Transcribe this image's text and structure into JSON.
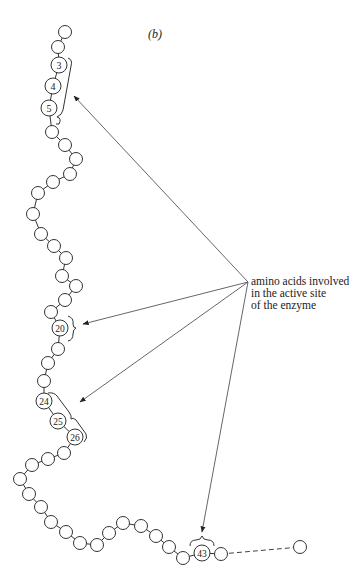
{
  "panel_label": "(b)",
  "annotation": {
    "lines": [
      "amino acids involved",
      "in the active site",
      "of the enzyme"
    ],
    "origin": [
      248,
      282
    ]
  },
  "colors": {
    "stroke": "#333333",
    "arrow": "#555555",
    "background": "#ffffff"
  },
  "chain": {
    "residues": [
      {
        "x": 65,
        "y": 32,
        "n": ""
      },
      {
        "x": 58,
        "y": 47,
        "n": ""
      },
      {
        "x": 59,
        "y": 65,
        "n": "3"
      },
      {
        "x": 53,
        "y": 86,
        "n": "4"
      },
      {
        "x": 49,
        "y": 108,
        "n": "5"
      },
      {
        "x": 52,
        "y": 132,
        "n": ""
      },
      {
        "x": 65,
        "y": 145,
        "n": ""
      },
      {
        "x": 76,
        "y": 159,
        "n": ""
      },
      {
        "x": 70,
        "y": 174,
        "n": ""
      },
      {
        "x": 53,
        "y": 182,
        "n": ""
      },
      {
        "x": 38,
        "y": 193,
        "n": ""
      },
      {
        "x": 33,
        "y": 214,
        "n": ""
      },
      {
        "x": 41,
        "y": 234,
        "n": ""
      },
      {
        "x": 54,
        "y": 246,
        "n": ""
      },
      {
        "x": 66,
        "y": 258,
        "n": ""
      },
      {
        "x": 62,
        "y": 276,
        "n": ""
      },
      {
        "x": 76,
        "y": 286,
        "n": ""
      },
      {
        "x": 65,
        "y": 300,
        "n": ""
      },
      {
        "x": 51,
        "y": 312,
        "n": ""
      },
      {
        "x": 60,
        "y": 328,
        "n": "20"
      },
      {
        "x": 58,
        "y": 349,
        "n": ""
      },
      {
        "x": 48,
        "y": 363,
        "n": ""
      },
      {
        "x": 44,
        "y": 381,
        "n": ""
      },
      {
        "x": 44,
        "y": 401,
        "n": "24"
      },
      {
        "x": 58,
        "y": 421,
        "n": "25"
      },
      {
        "x": 75,
        "y": 437,
        "n": "26"
      },
      {
        "x": 64,
        "y": 453,
        "n": ""
      },
      {
        "x": 48,
        "y": 459,
        "n": ""
      },
      {
        "x": 32,
        "y": 465,
        "n": ""
      },
      {
        "x": 20,
        "y": 479,
        "n": ""
      },
      {
        "x": 29,
        "y": 494,
        "n": ""
      },
      {
        "x": 41,
        "y": 507,
        "n": ""
      },
      {
        "x": 51,
        "y": 522,
        "n": ""
      },
      {
        "x": 66,
        "y": 532,
        "n": ""
      },
      {
        "x": 80,
        "y": 543,
        "n": ""
      },
      {
        "x": 97,
        "y": 545,
        "n": ""
      },
      {
        "x": 109,
        "y": 533,
        "n": ""
      },
      {
        "x": 123,
        "y": 523,
        "n": ""
      },
      {
        "x": 141,
        "y": 526,
        "n": ""
      },
      {
        "x": 156,
        "y": 536,
        "n": ""
      },
      {
        "x": 169,
        "y": 547,
        "n": ""
      },
      {
        "x": 183,
        "y": 558,
        "n": ""
      },
      {
        "x": 202,
        "y": 553,
        "n": "43"
      },
      {
        "x": 221,
        "y": 554,
        "n": ""
      }
    ],
    "tail": {
      "x": 300,
      "y": 547
    },
    "radius": 6.5,
    "numbered_radius": 8
  },
  "arrows": [
    {
      "target": "residues 3-5",
      "to": [
        74,
        96
      ]
    },
    {
      "target": "residue 20",
      "to": [
        83,
        324
      ]
    },
    {
      "target": "residues 24-26",
      "to": [
        80,
        402
      ]
    },
    {
      "target": "residue 43",
      "to": [
        202,
        532
      ]
    }
  ]
}
